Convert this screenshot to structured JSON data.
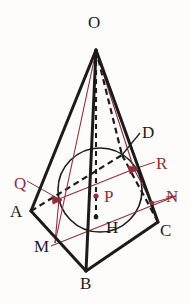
{
  "figure": {
    "kind": "geometry-diagram",
    "background_color": "#fdfcfb",
    "stroke_color_solid": "#1b1b1b",
    "stroke_color_red": "#8f2e38",
    "labels": [
      {
        "id": "O",
        "text": "O",
        "color": "#1b1b1b",
        "x": 88,
        "y": 14
      },
      {
        "id": "D",
        "text": "D",
        "color": "#1b1b1b",
        "x": 142,
        "y": 124
      },
      {
        "id": "R",
        "text": "R",
        "color": "#8f2e38",
        "x": 156,
        "y": 155
      },
      {
        "id": "Q",
        "text": "Q",
        "color": "#8f2e38",
        "x": 14,
        "y": 175
      },
      {
        "id": "P",
        "text": "P",
        "color": "#8f2e38",
        "x": 104,
        "y": 188
      },
      {
        "id": "N",
        "text": "N",
        "color": "#8f2e38",
        "x": 166,
        "y": 188
      },
      {
        "id": "A",
        "text": "A",
        "color": "#1b1b1b",
        "x": 10,
        "y": 203
      },
      {
        "id": "H",
        "text": "H",
        "color": "#1b1b1b",
        "x": 106,
        "y": 219
      },
      {
        "id": "C",
        "text": "C",
        "color": "#1b1b1b",
        "x": 160,
        "y": 222
      },
      {
        "id": "M",
        "text": "M",
        "color": "#1b1b1b",
        "x": 34,
        "y": 238
      },
      {
        "id": "B",
        "text": "B",
        "color": "#1b1b1b",
        "x": 80,
        "y": 275
      }
    ],
    "points": {
      "O": {
        "x": 96,
        "y": 50
      },
      "A": {
        "x": 31,
        "y": 211
      },
      "B": {
        "x": 86,
        "y": 271
      },
      "C": {
        "x": 158,
        "y": 222
      },
      "D": {
        "x": 122,
        "y": 155
      },
      "H": {
        "x": 96,
        "y": 217
      },
      "P": {
        "x": 96,
        "y": 196
      },
      "M": {
        "x": 55,
        "y": 243
      },
      "N": {
        "x": 152,
        "y": 203
      },
      "Q": {
        "x": 59,
        "y": 199
      },
      "R": {
        "x": 134,
        "y": 169
      }
    },
    "circle": {
      "cx": 100,
      "cy": 190,
      "r": 42
    },
    "segments": [
      {
        "name": "O-A",
        "style": "solid-thick",
        "color": "#1b1b1b"
      },
      {
        "name": "O-B",
        "style": "solid-thick",
        "color": "#1b1b1b"
      },
      {
        "name": "O-C",
        "style": "solid-thick",
        "color": "#1b1b1b"
      },
      {
        "name": "O-D",
        "style": "dashed",
        "color": "#1b1b1b"
      },
      {
        "name": "O-H",
        "style": "dashed",
        "color": "#1b1b1b"
      },
      {
        "name": "A-B",
        "style": "solid-thick",
        "color": "#1b1b1b"
      },
      {
        "name": "B-C",
        "style": "solid-thick",
        "color": "#1b1b1b"
      },
      {
        "name": "A-D",
        "style": "dashed",
        "color": "#1b1b1b"
      },
      {
        "name": "D-C",
        "style": "dashed",
        "color": "#1b1b1b"
      },
      {
        "name": "O-M",
        "style": "solid-thin",
        "color": "#8f2e38"
      },
      {
        "name": "O-R",
        "style": "solid-thin",
        "color": "#8f2e38"
      },
      {
        "name": "M-N",
        "style": "solid-thin",
        "color": "#8f2e38"
      },
      {
        "name": "Q-R",
        "style": "solid-thin",
        "color": "#8f2e38"
      },
      {
        "name": "M-Q",
        "style": "solid-thin",
        "color": "#8f2e38"
      },
      {
        "name": "leader-Q",
        "style": "solid-thin",
        "color": "#8f2e38"
      },
      {
        "name": "leader-R",
        "style": "solid-thin",
        "color": "#8f2e38"
      },
      {
        "name": "leader-N",
        "style": "solid-thin",
        "color": "#8f2e38"
      },
      {
        "name": "leader-D",
        "style": "solid-thin",
        "color": "#1b1b1b"
      }
    ],
    "marked_points": [
      {
        "id": "P",
        "color": "#8f2e38"
      },
      {
        "id": "Q",
        "color": "#8f2e38"
      },
      {
        "id": "R",
        "color": "#8f2e38"
      },
      {
        "id": "H",
        "color": "#1b1b1b"
      },
      {
        "id": "N",
        "color": "#8f2e38"
      }
    ]
  }
}
